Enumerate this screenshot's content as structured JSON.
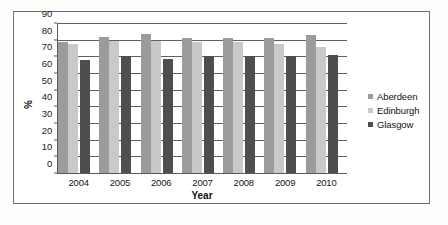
{
  "chart_data": {
    "type": "bar",
    "title": "",
    "xlabel": "Year",
    "ylabel": "%",
    "categories": [
      "2004",
      "2005",
      "2006",
      "2007",
      "2008",
      "2009",
      "2010"
    ],
    "series": [
      {
        "name": "Aberdeen",
        "color": "#9b9b9b",
        "values": [
          79.0,
          82.0,
          84.0,
          81.5,
          81.5,
          81.5,
          83.5
        ]
      },
      {
        "name": "Edinburgh",
        "color": "#c9c9c9",
        "values": [
          78.0,
          79.5,
          79.5,
          79.0,
          79.0,
          78.0,
          76.0
        ]
      },
      {
        "name": "Glasgow",
        "color": "#4e4e4e",
        "values": [
          68.5,
          70.5,
          69.0,
          70.5,
          70.5,
          70.5,
          71.5
        ]
      }
    ],
    "ylim": [
      0,
      90
    ],
    "yticks": [
      0,
      10,
      20,
      30,
      40,
      50,
      60,
      70,
      80,
      90
    ],
    "ytick_labels": [
      "0",
      "10",
      "20",
      "30",
      "40",
      "50",
      "60",
      "70",
      "80",
      "90"
    ],
    "grid": true,
    "grid_axis": "y",
    "legend_position": "right",
    "legend": [
      "Aberdeen",
      "Edinburgh",
      "Glasgow"
    ]
  }
}
